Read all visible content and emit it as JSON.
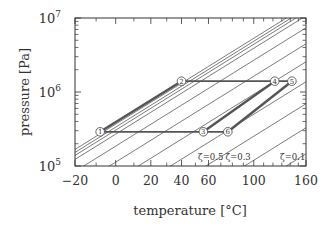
{
  "chart_data": {
    "type": "line",
    "title": "",
    "xlabel": "temperature [°C]",
    "ylabel": "pressure [Pa]",
    "x_scale": "inverse-absolute-temperature (-1/T)",
    "y_scale": "log",
    "xlim": [
      -20,
      160
    ],
    "ylim": [
      100000,
      10000000
    ],
    "x_ticks": [
      -20,
      0,
      20,
      40,
      60,
      100,
      160
    ],
    "x_tick_labels": [
      "−20",
      "0",
      "20",
      "40",
      "60",
      "100",
      "160"
    ],
    "x_minor_ticks": [
      -10,
      10,
      30,
      50,
      70,
      80,
      90,
      110,
      120,
      130,
      140,
      150
    ],
    "y_ticks": [
      100000,
      1000000,
      10000000
    ],
    "y_tick_labels": [
      {
        "base": "10",
        "exp": "5"
      },
      {
        "base": "10",
        "exp": "6"
      },
      {
        "base": "10",
        "exp": "7"
      }
    ],
    "grid": false,
    "isosteres": {
      "description": "family of parallel isostere lines (constant loading ζ)",
      "count": 14,
      "labels": [
        {
          "text": "ζ=0.5",
          "x": 52,
          "y": 200000
        },
        {
          "text": "ζ=0.3",
          "x": 74,
          "y": 200000
        },
        {
          "text": "ζ=0.1",
          "x": 128,
          "y": 200000
        }
      ]
    },
    "cycle": {
      "points": [
        {
          "id": "1",
          "label": "1",
          "T": -8,
          "p": 290000
        },
        {
          "id": "2",
          "label": "2",
          "T": 40,
          "p": 1400000
        },
        {
          "id": "3",
          "label": "3",
          "T": 56,
          "p": 290000
        },
        {
          "id": "4",
          "label": "4",
          "T": 122,
          "p": 1400000
        },
        {
          "id": "5",
          "label": "5",
          "T": 142,
          "p": 1400000
        },
        {
          "id": "6",
          "label": "6",
          "T": 76,
          "p": 290000
        }
      ],
      "segments": [
        {
          "from": "1",
          "to": "2",
          "style": "thick"
        },
        {
          "from": "2",
          "to": "4",
          "style": "medium"
        },
        {
          "from": "4",
          "to": "5",
          "style": "medium"
        },
        {
          "from": "1",
          "to": "3",
          "style": "medium"
        },
        {
          "from": "3",
          "to": "6",
          "style": "medium"
        },
        {
          "from": "3",
          "to": "4",
          "style": "thick"
        },
        {
          "from": "6",
          "to": "5",
          "style": "thick"
        }
      ]
    },
    "colors": {
      "axis": "#333333",
      "isostere": "#444444",
      "cycle": "#555555",
      "marker_fill": "#ffffff"
    }
  }
}
